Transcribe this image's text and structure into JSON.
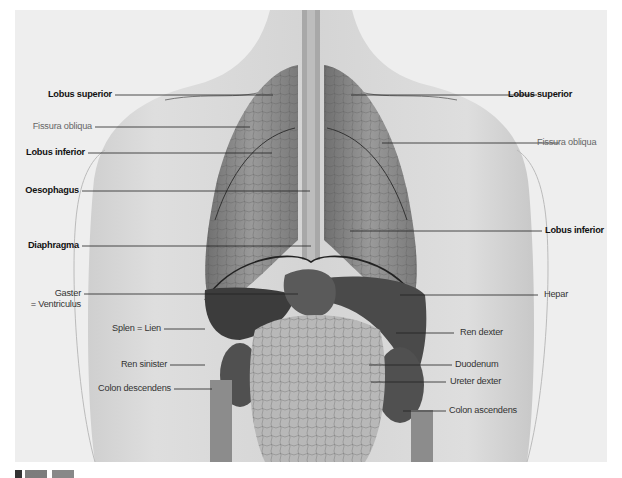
{
  "figure": {
    "colors": {
      "background": "#eeeeee",
      "skin": "#d9d9d9",
      "lung": "#8a8a8a",
      "organ_dark": "#3c3c3c",
      "leader_line": "#222222"
    }
  },
  "labels_left": [
    {
      "id": "lobus-superior-left",
      "text": "Lobus superior",
      "style": "bold"
    },
    {
      "id": "fissura-obliqua-left",
      "text": "Fissura obliqua",
      "style": "gray"
    },
    {
      "id": "lobus-inferior-left",
      "text": "Lobus inferior",
      "style": "bold"
    },
    {
      "id": "oesophagus",
      "text": "Oesophagus",
      "style": "bold"
    },
    {
      "id": "diaphragma",
      "text": "Diaphragma",
      "style": "bold"
    },
    {
      "id": "gaster",
      "text": "Gaster",
      "line2": "= Ventriculus",
      "style": "regular"
    },
    {
      "id": "splen",
      "text": "Splen = Lien",
      "style": "regular"
    },
    {
      "id": "ren-sinister",
      "text": "Ren sinister",
      "style": "regular"
    },
    {
      "id": "colon-descendens",
      "text": "Colon descendens",
      "style": "regular"
    }
  ],
  "labels_right": [
    {
      "id": "lobus-superior-right",
      "text": "Lobus superior",
      "style": "bold"
    },
    {
      "id": "fissura-obliqua-right",
      "text": "Fissura obliqua",
      "style": "gray"
    },
    {
      "id": "lobus-inferior-right",
      "text": "Lobus inferior",
      "style": "bold"
    },
    {
      "id": "hepar",
      "text": "Hepar",
      "style": "regular"
    },
    {
      "id": "ren-dexter",
      "text": "Ren dexter",
      "style": "regular"
    },
    {
      "id": "duodenum",
      "text": "Duodenum",
      "style": "regular"
    },
    {
      "id": "ureter-dexter",
      "text": "Ureter dexter",
      "style": "regular"
    },
    {
      "id": "colon-ascendens",
      "text": "Colon ascendens",
      "style": "regular"
    }
  ]
}
